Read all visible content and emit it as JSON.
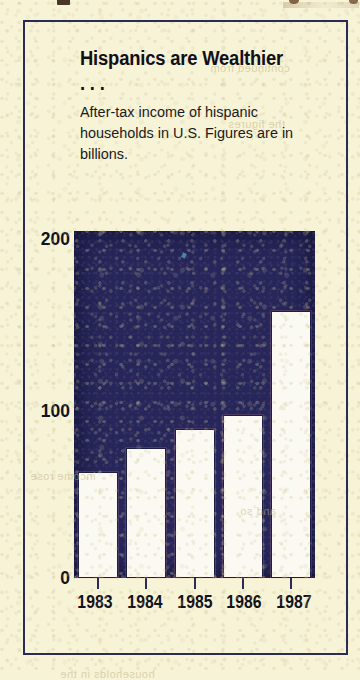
{
  "figure": {
    "headline": "Hispanics are Wealthier . . .",
    "subhead": "After-tax income of hispanic households in U.S. Figures are in billions.",
    "paper_color": "#f7f3d6",
    "ink_color": "#2b2b55",
    "plot_color": "#26265a",
    "bar_color": "#fbfaf2"
  },
  "chart_data": {
    "type": "bar",
    "title": "Hispanics are Wealthier . . .",
    "subtitle": "After-tax income of hispanic households in U.S. Figures are in billions.",
    "categories": [
      "1983",
      "1984",
      "1985",
      "1986",
      "1987"
    ],
    "values": [
      61,
      75,
      86,
      94,
      154
    ],
    "xlabel": "",
    "ylabel": "",
    "ylim": [
      0,
      200
    ],
    "yticks": [
      "0",
      "100",
      "200"
    ],
    "grid": false,
    "legend": "none",
    "units": "billions of dollars"
  }
}
